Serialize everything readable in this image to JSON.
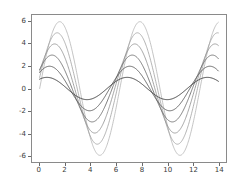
{
  "chart_data": {
    "type": "line",
    "title": "",
    "subtitle": "",
    "xlabel": "",
    "ylabel": "",
    "xlim": [
      -0.6,
      14.6
    ],
    "ylim": [
      -6.6,
      6.6
    ],
    "xticks": [
      0,
      2,
      4,
      6,
      8,
      10,
      12,
      14
    ],
    "xtick_labels": [
      "0",
      "2",
      "4",
      "6",
      "8",
      "10",
      "12",
      "14"
    ],
    "yticks": [
      6,
      4,
      2,
      0,
      -2,
      -4,
      -6
    ],
    "ytick_labels": [
      "6",
      "4",
      "2",
      "0",
      "-2",
      "-4",
      "-6"
    ],
    "grid": false,
    "legend": null,
    "legend_position": "none",
    "x_range_data": [
      0,
      14
    ],
    "series": [
      {
        "name": "6*sin(x + 0.0)",
        "amplitude": 6,
        "phase": 0.0,
        "frequency": 1.0,
        "color": "#b4b4b4",
        "linewidth": 0.8,
        "y_at_x0": 0.0,
        "peak_x": 1.57,
        "peak_y": 6,
        "trough_x": 4.71,
        "trough_y": -6
      },
      {
        "name": "5*sin(x + 0.2)",
        "amplitude": 5,
        "phase": 0.2,
        "frequency": 1.0,
        "color": "#a0a0a0",
        "linewidth": 0.8,
        "y_at_x0": 0.99,
        "peak_x": 1.37,
        "peak_y": 5,
        "trough_x": 4.51,
        "trough_y": -5
      },
      {
        "name": "4*sin(x + 0.4)",
        "amplitude": 4,
        "phase": 0.4,
        "frequency": 1.0,
        "color": "#8c8c8c",
        "linewidth": 0.8,
        "y_at_x0": 1.56,
        "peak_x": 1.17,
        "peak_y": 4,
        "trough_x": 4.31,
        "trough_y": -4
      },
      {
        "name": "3*sin(x + 0.6)",
        "amplitude": 3,
        "phase": 0.6,
        "frequency": 1.0,
        "color": "#6e6e6e",
        "linewidth": 0.9,
        "y_at_x0": 1.69,
        "peak_x": 0.97,
        "peak_y": 3,
        "trough_x": 4.11,
        "trough_y": -3
      },
      {
        "name": "2*sin(x + 0.8)",
        "amplitude": 2,
        "phase": 0.8,
        "frequency": 1.0,
        "color": "#555555",
        "linewidth": 0.9,
        "y_at_x0": 1.43,
        "peak_x": 0.77,
        "peak_y": 2,
        "trough_x": 3.91,
        "trough_y": -2
      },
      {
        "name": "1*sin(x + 1.0)",
        "amplitude": 1,
        "phase": 1.0,
        "frequency": 1.0,
        "color": "#3c3c3c",
        "linewidth": 1.0,
        "y_at_x0": 0.84,
        "peak_x": 0.57,
        "peak_y": 1,
        "trough_x": 3.71,
        "trough_y": -1
      }
    ]
  },
  "figure": {
    "background_color": "#ffffff",
    "frame_color": "#8a8a8a",
    "tick_color": "#6a6a6a",
    "tick_label_color": "#3a3a3a"
  }
}
